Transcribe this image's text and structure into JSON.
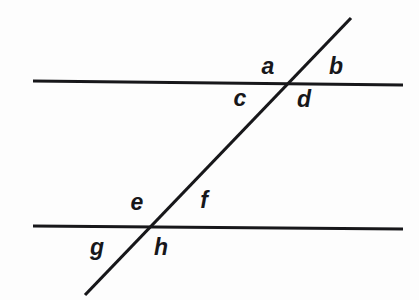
{
  "canvas": {
    "width": 419,
    "height": 300,
    "background_color": "#fdfdfd",
    "ink_color": "#17171a"
  },
  "figure": {
    "stroke_width": 3.2
  },
  "lines": [
    {
      "id": "upper-parallel-line",
      "role": "parallel-line",
      "x1": 33,
      "y1": 81,
      "x2": 403,
      "y2": 85
    },
    {
      "id": "lower-parallel-line",
      "role": "parallel-line",
      "x1": 33,
      "y1": 226,
      "x2": 403,
      "y2": 229
    },
    {
      "id": "transversal-line",
      "role": "transversal",
      "x1": 85,
      "y1": 295,
      "x2": 351,
      "y2": 18
    }
  ],
  "intersections": [
    {
      "id": "upper-intersection",
      "x": 289,
      "y": 83
    },
    {
      "id": "lower-intersection",
      "x": 148,
      "y": 227
    }
  ],
  "labels": [
    {
      "id": "angle-a",
      "text": "a",
      "x": 268,
      "y": 66,
      "position": "upper-left-of-upper-intersection"
    },
    {
      "id": "angle-b",
      "text": "b",
      "x": 336,
      "y": 66,
      "position": "upper-right-of-upper-intersection"
    },
    {
      "id": "angle-c",
      "text": "c",
      "x": 240,
      "y": 98,
      "position": "lower-left-of-upper-intersection"
    },
    {
      "id": "angle-d",
      "text": "d",
      "x": 304,
      "y": 99,
      "position": "lower-right-of-upper-intersection"
    },
    {
      "id": "angle-e",
      "text": "e",
      "x": 137,
      "y": 202,
      "position": "upper-left-of-lower-intersection"
    },
    {
      "id": "angle-f",
      "text": "f",
      "x": 204,
      "y": 200,
      "position": "upper-right-of-lower-intersection"
    },
    {
      "id": "angle-g",
      "text": "g",
      "x": 97,
      "y": 247,
      "position": "lower-left-of-lower-intersection"
    },
    {
      "id": "angle-h",
      "text": "h",
      "x": 161,
      "y": 247,
      "position": "lower-right-of-lower-intersection"
    }
  ]
}
